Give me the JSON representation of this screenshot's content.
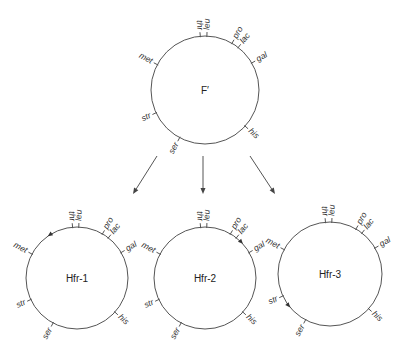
{
  "diagram": {
    "title": "",
    "colors": {
      "line": "#555555",
      "text": "#333333",
      "background": "#ffffff"
    },
    "genes": [
      "thr",
      "leu",
      "pro",
      "lac",
      "gal",
      "his",
      "ser",
      "str",
      "met"
    ],
    "gene_angles_deg": {
      "thr": -95,
      "leu": -88,
      "pro": -60,
      "lac": -52,
      "gal": -30,
      "his": 42,
      "ser": 118,
      "str": 155,
      "met": -152
    },
    "parent": {
      "label": "F′",
      "center": [
        205,
        90
      ],
      "radius": 54
    },
    "arrows": [
      {
        "from": [
          157,
          156
        ],
        "to": [
          133,
          194
        ]
      },
      {
        "from": [
          203,
          156
        ],
        "to": [
          203,
          194
        ]
      },
      {
        "from": [
          250,
          156
        ],
        "to": [
          275,
          194
        ]
      }
    ],
    "strains": [
      {
        "label": "Hfr-1",
        "center": [
          77,
          278
        ],
        "radius": 51,
        "origin_angle_deg": -125,
        "direction": "counterclockwise"
      },
      {
        "label": "Hfr-2",
        "center": [
          205,
          278
        ],
        "radius": 51,
        "origin_angle_deg": -42,
        "direction": "clockwise"
      },
      {
        "label": "Hfr-3",
        "center": [
          330,
          274
        ],
        "radius": 52,
        "origin_angle_deg": 140,
        "direction": "counterclockwise"
      }
    ]
  }
}
